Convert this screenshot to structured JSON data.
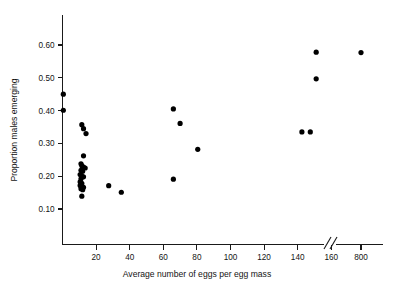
{
  "chart_data": {
    "type": "scatter",
    "title": "",
    "xlabel": "Average number of eggs per egg mass",
    "ylabel": "Proportion males emerging",
    "xlim": [
      0,
      175
    ],
    "ylim": [
      0.05,
      0.655
    ],
    "grid": false,
    "legend": null,
    "axis_break": {
      "present": true,
      "between": [
        165,
        175
      ],
      "note": "double-slash break on x-axis between 160 and 800"
    },
    "xticks": [
      20,
      40,
      60,
      80,
      100,
      120,
      140,
      160,
      800
    ],
    "xtick_labels": [
      "20",
      "40",
      "60",
      "80",
      "100",
      "120",
      "140",
      "160",
      "800"
    ],
    "yticks": [
      0.1,
      0.2,
      0.3,
      0.4,
      0.5,
      0.6
    ],
    "ytick_labels": [
      "0.10",
      "0.20",
      "0.30",
      "0.40",
      "0.50",
      "0.60"
    ],
    "marker": "filled-circle",
    "marker_color": "#000000",
    "points": [
      {
        "x": 0.5,
        "y": 0.45
      },
      {
        "x": 0.5,
        "y": 0.401
      },
      {
        "x": 11.5,
        "y": 0.357
      },
      {
        "x": 12.5,
        "y": 0.345
      },
      {
        "x": 14.0,
        "y": 0.33
      },
      {
        "x": 12.5,
        "y": 0.262
      },
      {
        "x": 11.0,
        "y": 0.238
      },
      {
        "x": 11.5,
        "y": 0.232
      },
      {
        "x": 12.5,
        "y": 0.228
      },
      {
        "x": 13.5,
        "y": 0.225
      },
      {
        "x": 11.0,
        "y": 0.218
      },
      {
        "x": 12.0,
        "y": 0.215
      },
      {
        "x": 10.5,
        "y": 0.205
      },
      {
        "x": 11.5,
        "y": 0.2
      },
      {
        "x": 12.5,
        "y": 0.198
      },
      {
        "x": 11.0,
        "y": 0.192
      },
      {
        "x": 10.5,
        "y": 0.183
      },
      {
        "x": 11.5,
        "y": 0.178
      },
      {
        "x": 10.5,
        "y": 0.172
      },
      {
        "x": 11.5,
        "y": 0.168
      },
      {
        "x": 12.5,
        "y": 0.166
      },
      {
        "x": 11.0,
        "y": 0.162
      },
      {
        "x": 12.0,
        "y": 0.159
      },
      {
        "x": 11.5,
        "y": 0.139
      },
      {
        "x": 27.5,
        "y": 0.171
      },
      {
        "x": 35.0,
        "y": 0.151
      },
      {
        "x": 66.0,
        "y": 0.405
      },
      {
        "x": 70.0,
        "y": 0.361
      },
      {
        "x": 80.5,
        "y": 0.282
      },
      {
        "x": 66.0,
        "y": 0.191
      },
      {
        "x": 142.5,
        "y": 0.335
      },
      {
        "x": 147.5,
        "y": 0.335
      },
      {
        "x": 151.0,
        "y": 0.578
      },
      {
        "x": 151.0,
        "y": 0.497
      },
      {
        "x": 800.0,
        "y": 0.577
      }
    ]
  }
}
